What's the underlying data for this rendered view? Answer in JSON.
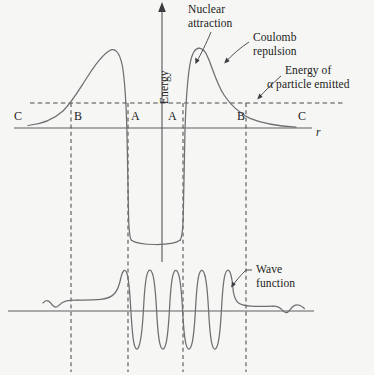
{
  "figure": {
    "background_color": "#f6f6f4",
    "curve_color": "#6f6f72",
    "axis_color": "#5e5e62",
    "dash_color": "#4a4a4e",
    "text_color": "#1b1b1b"
  },
  "axes": {
    "y_label": "Energy",
    "x_label": "r",
    "x_axis_y": 128,
    "y_axis_x": 162,
    "energy_level_y": 103,
    "wave_baseline_y": 311
  },
  "annotations": {
    "nuclear_attraction": "Nuclear\nattraction",
    "nuclear_attraction_line1": "Nuclear",
    "nuclear_attraction_line2": "attraction",
    "coulomb_repulsion_line1": "Coulomb",
    "coulomb_repulsion_line2": "repulsion",
    "energy_of_alpha_line1": "Energy of",
    "energy_of_alpha_line2": "α particle emitted",
    "wave_function_line1": "Wave",
    "wave_function_line2": "function"
  },
  "zone_labels": [
    {
      "text": "C",
      "x": 14,
      "y": 110
    },
    {
      "text": "B",
      "x": 74,
      "y": 110
    },
    {
      "text": "A",
      "x": 131,
      "y": 110
    },
    {
      "text": "A",
      "x": 168,
      "y": 110
    },
    {
      "text": "B",
      "x": 237,
      "y": 110
    },
    {
      "text": "C",
      "x": 298,
      "y": 110
    }
  ],
  "chart_data": {
    "type": "line",
    "xlabel": "r",
    "ylabel": "Energy",
    "grid": false,
    "legend": "none",
    "annotations": [
      "Nuclear attraction",
      "Coulomb repulsion",
      "Energy of α particle emitted",
      "Wave function"
    ],
    "region_boundaries": {
      "C_left": 14,
      "B_left": 71,
      "A_left": 128,
      "A_right": 183,
      "B_right": 246,
      "C_right": 298
    },
    "series": [
      {
        "name": "Potential energy V(r)",
        "description": "Coulomb barrier outside the nucleus, deep square well inside; symmetric about r = 0",
        "key_points": [
          {
            "x": 30,
            "y": 124,
            "note": "far-left Coulomb tail near zero"
          },
          {
            "x": 71,
            "y": 103,
            "note": "left B: crosses alpha energy level"
          },
          {
            "x": 112,
            "y": 50,
            "note": "left barrier peak"
          },
          {
            "x": 128,
            "y": 130,
            "note": "left A: steep nuclear wall drop"
          },
          {
            "x": 131,
            "y": 240,
            "note": "well floor (nuclear attraction)"
          },
          {
            "x": 180,
            "y": 240,
            "note": "well floor right end"
          },
          {
            "x": 183,
            "y": 130,
            "note": "right A: steep nuclear wall rise"
          },
          {
            "x": 200,
            "y": 48,
            "note": "right barrier peak"
          },
          {
            "x": 246,
            "y": 103,
            "note": "right B: crosses alpha energy level"
          },
          {
            "x": 310,
            "y": 124,
            "note": "far-right Coulomb tail near zero"
          }
        ]
      },
      {
        "name": "Energy of alpha particle emitted",
        "description": "Horizontal dashed line at constant energy intersecting barrier at B points",
        "level_y": 103,
        "style": "dashed"
      },
      {
        "name": "Wave function psi(r)",
        "description": "Large standing-wave oscillation inside the well, exponential decay through the barrier, small oscillating travelling wave outside",
        "baseline_y": 311,
        "inside_amplitude": 40,
        "outside_amplitude": 6,
        "oscillation_count_inside": 5
      }
    ]
  }
}
